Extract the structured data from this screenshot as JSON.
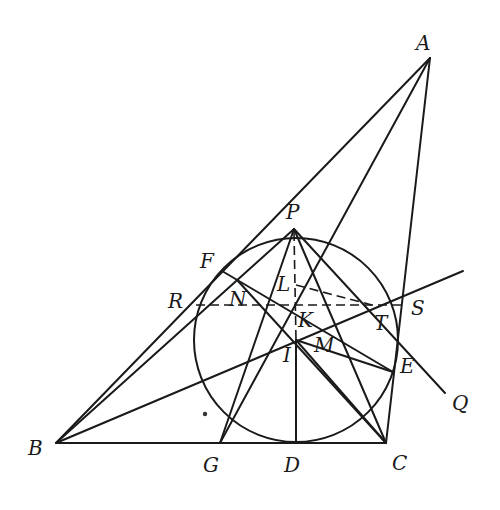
{
  "figure": {
    "type": "geometry-diagram",
    "stroke_color": "#1a1a1a",
    "points": {
      "A": {
        "label": "A",
        "x": 430,
        "y": 58
      },
      "B": {
        "label": "B",
        "x": 56,
        "y": 443
      },
      "C": {
        "label": "C",
        "x": 386,
        "y": 443
      },
      "D": {
        "label": "D",
        "x": 296,
        "y": 443
      },
      "G": {
        "label": "G",
        "x": 220,
        "y": 443
      },
      "P": {
        "label": "P",
        "x": 294,
        "y": 229
      },
      "I": {
        "label": "I",
        "x": 296,
        "y": 340
      },
      "K": {
        "label": "K",
        "x": 296,
        "y": 305
      },
      "L": {
        "label": "L",
        "x": 296,
        "y": 285
      },
      "M": {
        "label": "M",
        "x": 336,
        "y": 325
      },
      "N": {
        "label": "N",
        "x": 238,
        "y": 281
      },
      "F": {
        "label": "F",
        "x": 222,
        "y": 271
      },
      "E": {
        "label": "E",
        "x": 393,
        "y": 372
      },
      "R": {
        "label": "R",
        "x": 196,
        "y": 305
      },
      "S": {
        "label": "S",
        "x": 402,
        "y": 305
      },
      "T": {
        "label": "T",
        "x": 372,
        "y": 305
      },
      "Q": {
        "label": "Q",
        "x": 445,
        "y": 393
      }
    },
    "labels": [
      {
        "text": "A",
        "x": 416,
        "y": 50
      },
      {
        "text": "B",
        "x": 28,
        "y": 455
      },
      {
        "text": "C",
        "x": 392,
        "y": 470
      },
      {
        "text": "D",
        "x": 284,
        "y": 472
      },
      {
        "text": "G",
        "x": 203,
        "y": 472
      },
      {
        "text": "P",
        "x": 286,
        "y": 219
      },
      {
        "text": "F",
        "x": 200,
        "y": 268
      },
      {
        "text": "R",
        "x": 168,
        "y": 308
      },
      {
        "text": "N",
        "x": 229,
        "y": 306
      },
      {
        "text": "L",
        "x": 277,
        "y": 291
      },
      {
        "text": "K",
        "x": 298,
        "y": 327
      },
      {
        "text": "I",
        "x": 283,
        "y": 362
      },
      {
        "text": "M",
        "x": 314,
        "y": 352
      },
      {
        "text": "S",
        "x": 411,
        "y": 315
      },
      {
        "text": "T",
        "x": 374,
        "y": 330
      },
      {
        "text": "E",
        "x": 400,
        "y": 373
      },
      {
        "text": "Q",
        "x": 452,
        "y": 410
      }
    ],
    "incircle": {
      "center": "I",
      "cx": 296,
      "cy": 340,
      "r": 102
    }
  }
}
